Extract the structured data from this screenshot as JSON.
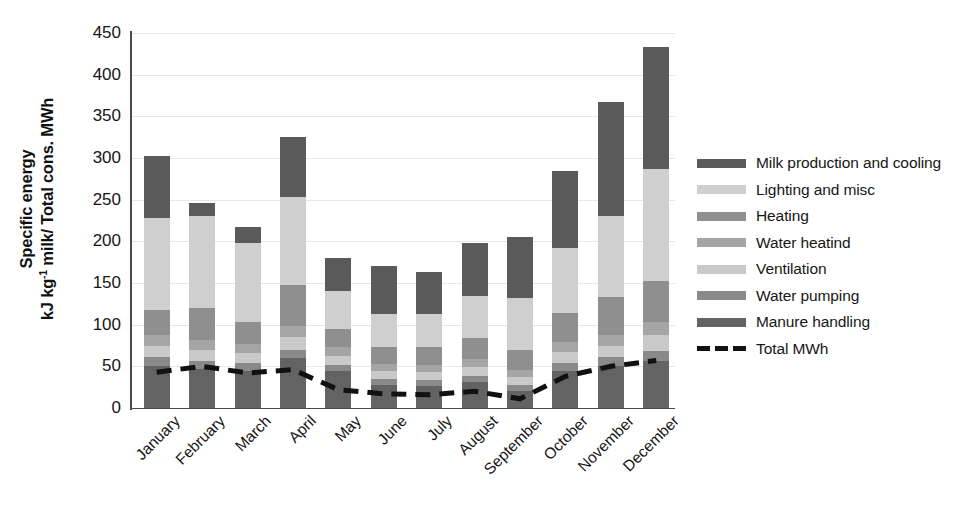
{
  "chart_data": {
    "type": "bar",
    "stacked": true,
    "title": "",
    "xlabel": "",
    "ylabel": "Specific energy kJ kg-1 milk/ Total cons. MWh",
    "ylabel_lines": [
      "Specific energy",
      "kJ kg-1 milk/ Total cons. MWh"
    ],
    "ylim": [
      0,
      450
    ],
    "ytick_values": [
      0,
      50,
      100,
      150,
      200,
      250,
      300,
      350,
      400,
      450
    ],
    "ytick_labels": [
      "0",
      "50",
      "100",
      "150",
      "200",
      "250",
      "300",
      "350",
      "400",
      "450"
    ],
    "grid": true,
    "grid_axis": "y",
    "legend_position": "right",
    "categories": [
      "January",
      "February",
      "March",
      "April",
      "May",
      "June",
      "July",
      "August",
      "September",
      "October",
      "November",
      "December"
    ],
    "series": [
      {
        "name": "Manure handling",
        "color": "#636363",
        "values": [
          50,
          47,
          45,
          60,
          44,
          28,
          27,
          31,
          20,
          44,
          50,
          57
        ]
      },
      {
        "name": "Water pumping",
        "color": "#8a8a8a",
        "values": [
          11,
          10,
          9,
          10,
          8,
          7,
          7,
          8,
          8,
          10,
          11,
          12
        ]
      },
      {
        "name": "Ventilation",
        "color": "#c9c9c9",
        "values": [
          14,
          13,
          12,
          15,
          11,
          9,
          9,
          10,
          9,
          13,
          14,
          19
        ]
      },
      {
        "name": "Water heatind",
        "color": "#a5a5a5",
        "values": [
          13,
          12,
          11,
          13,
          10,
          9,
          9,
          10,
          9,
          12,
          13,
          15
        ]
      },
      {
        "name": "Heating",
        "color": "#8f8f8f",
        "values": [
          30,
          38,
          26,
          50,
          22,
          20,
          21,
          25,
          24,
          35,
          45,
          49
        ]
      },
      {
        "name": "Lighting and misc",
        "color": "#cfcfcf",
        "values": [
          110,
          110,
          95,
          105,
          45,
          40,
          40,
          50,
          62,
          78,
          98,
          135
        ]
      },
      {
        "name": "Milk production and cooling",
        "color": "#5a5a5a",
        "values": [
          75,
          16,
          19,
          72,
          40,
          57,
          50,
          64,
          73,
          93,
          136,
          146
        ]
      }
    ],
    "totals": [
      303,
      246,
      217,
      325,
      180,
      170,
      163,
      198,
      205,
      285,
      367,
      433
    ],
    "line_series": {
      "name": "Total MWh",
      "style": "dashed",
      "color": "#111111",
      "values": [
        43,
        50,
        42,
        46,
        22,
        17,
        16,
        20,
        11,
        38,
        50,
        57
      ]
    }
  },
  "legend": {
    "items": [
      {
        "label": "Milk production and cooling",
        "color": "#5a5a5a",
        "type": "swatch"
      },
      {
        "label": "Lighting and misc",
        "color": "#cfcfcf",
        "type": "swatch"
      },
      {
        "label": "Heating",
        "color": "#8f8f8f",
        "type": "swatch"
      },
      {
        "label": "Water heatind",
        "color": "#a5a5a5",
        "type": "swatch"
      },
      {
        "label": "Ventilation",
        "color": "#c9c9c9",
        "type": "swatch"
      },
      {
        "label": "Water pumping",
        "color": "#8a8a8a",
        "type": "swatch"
      },
      {
        "label": "Manure handling",
        "color": "#636363",
        "type": "swatch"
      },
      {
        "label": "Total MWh",
        "color": "#111111",
        "type": "dashed-line"
      }
    ]
  },
  "axis": {
    "y_title_line1": "Specific energy",
    "y_title_line2_pre": "kJ kg",
    "y_title_line2_exp": "-1",
    "y_title_line2_post": " milk/ Total cons. MWh"
  }
}
